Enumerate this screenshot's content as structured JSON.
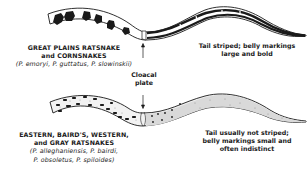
{
  "diagram": {
    "top_group": {
      "common_name_line1": "GREAT PLAINS RATSNAKE",
      "common_name_line2": "and CORNSNAKES",
      "scientific_names": "(P. emoryi, P. guttatus, P. slowinskii)",
      "description_line1": "Tail striped; belly markings",
      "description_line2": "large and bold"
    },
    "center_label": {
      "line1": "Cloacal",
      "line2": "plate"
    },
    "bottom_group": {
      "common_name_line1": "EASTERN, BAIRD'S, WESTERN,",
      "common_name_line2": "and GRAY RATSNAKES",
      "scientific_line1": "(P. alleghaniensis, P. bairdi,",
      "scientific_line2": "P. obsoletus, P. spiloides)",
      "description_line1": "Tail usually not striped;",
      "description_line2": "belly markings small and",
      "description_line3": "often indistinct"
    },
    "colors": {
      "ink": "#1a1a1a",
      "stipple_fill": "#d9d9d9",
      "background": "#ffffff"
    }
  }
}
